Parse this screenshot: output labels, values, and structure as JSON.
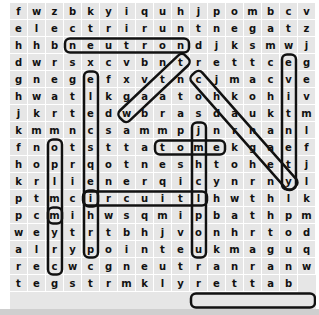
{
  "puzzle": {
    "rows": [
      "fwzbkyiquhjpombcv",
      "electriruntnegatzw",
      "hhbneutrondjksmwj",
      "dwrsxcvbntrettceg",
      "gnegefxvtncjmacve",
      "hwatlkgaatohkohiv",
      "jkrtedwbrasdauktm",
      "kmmncsammpjnrnan",
      "lfnotsttatomekgae",
      "fhoprqotneshtohet",
      "jkrlienerqicynrny",
      "lptmcircuitlhwthl",
      "kpcmihwsqmipbathp",
      "mweytrtbhjvonhrto",
      "dalrypointeukmagu",
      "qrecwcgneutranranp",
      "wtegstrmklyrettab"
    ],
    "found_words": [
      {
        "word": "neutron",
        "cells": [
          [
            2,
            3
          ],
          [
            2,
            9
          ]
        ]
      },
      {
        "word": "circuit",
        "cells": [
          [
            11,
            4
          ],
          [
            11,
            10
          ]
        ]
      },
      {
        "word": "atom",
        "cells": [
          [
            8,
            8
          ],
          [
            8,
            11
          ]
        ]
      },
      {
        "word": "battery",
        "cells": [
          [
            17,
            16
          ],
          [
            17,
            10
          ]
        ]
      },
      {
        "word": "electric",
        "cells": [
          [
            4,
            4
          ],
          [
            11,
            4
          ]
        ]
      },
      {
        "word": "north",
        "cells": [
          [
            8,
            2
          ],
          [
            12,
            2
          ]
        ]
      },
      {
        "word": "cell",
        "cells": [
          [
            12,
            2
          ],
          [
            15,
            2
          ]
        ]
      },
      {
        "word": "positive",
        "cells": [
          [
            7,
            10
          ],
          [
            14,
            10
          ]
        ]
      },
      {
        "word": "green",
        "cells": [
          [
            3,
            15
          ],
          [
            10,
            15
          ]
        ]
      },
      {
        "word": "wave",
        "cells": [
          [
            6,
            6
          ],
          [
            3,
            9
          ]
        ]
      },
      {
        "word": "conductor",
        "cells": [
          [
            4,
            10
          ],
          [
            10,
            15
          ]
        ]
      },
      {
        "word": "city",
        "cells": [
          [
            11,
            4
          ],
          [
            14,
            4
          ]
        ]
      }
    ]
  }
}
